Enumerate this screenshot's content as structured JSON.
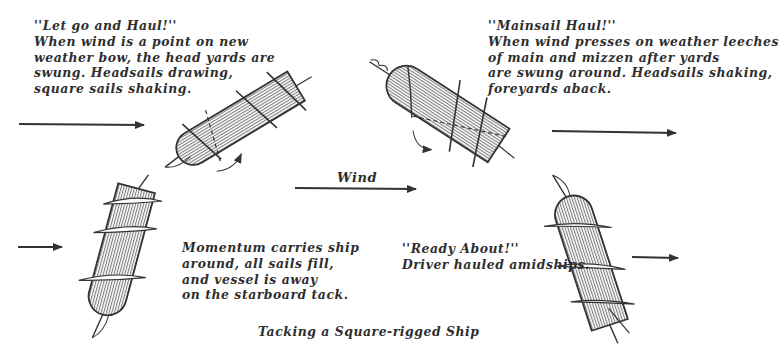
{
  "diagram": {
    "title": "Tacking a Square-rigged Ship",
    "wind_label": "Wind",
    "stages": [
      {
        "id": "let-go-and-haul",
        "lines": [
          "''Let go and Haul!''",
          "When wind is a point on new",
          "weather bow, the head yards are",
          "swung. Headsails drawing,",
          "square sails shaking."
        ]
      },
      {
        "id": "mainsail-haul",
        "lines": [
          "''Mainsail Haul!''",
          "When wind presses on weather leeches",
          "of main and mizzen after yards",
          "are swung around. Headsails shaking,",
          "foreyards aback."
        ]
      },
      {
        "id": "momentum",
        "lines": [
          "Momentum carries ship",
          "around, all sails fill,",
          "and vessel is away",
          "on the starboard tack."
        ]
      },
      {
        "id": "ready-about",
        "lines": [
          "''Ready About!''",
          "Driver hauled amidships."
        ]
      }
    ],
    "colors": {
      "ink": "#2e2e2e",
      "background": "#ffffff"
    }
  }
}
